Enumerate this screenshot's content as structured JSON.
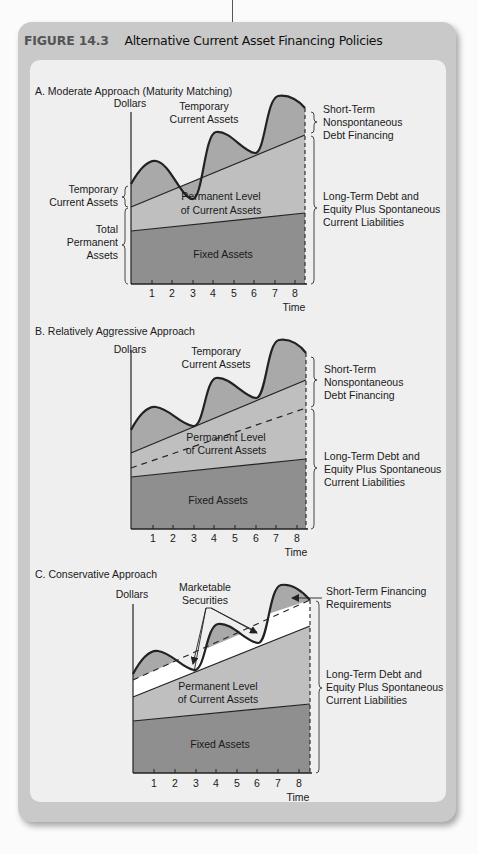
{
  "figure": {
    "number": "FIGURE 14.3",
    "title": "Alternative Current Asset Financing Policies"
  },
  "colors": {
    "frame": "#c9c9c9",
    "panel_bg": "#efefef",
    "temporary_area": "#a9a9a9",
    "permanent_current_area": "#bfbfbf",
    "fixed_area": "#8f8f8f",
    "marketable_securities": "#ffffff",
    "line": "#222222"
  },
  "panels": [
    {
      "id": "A",
      "heading": "A. Moderate Approach (Maturity Matching)",
      "y_label": "Dollars",
      "x_label": "Time",
      "ticks": [
        "1",
        "2",
        "3",
        "4",
        "5",
        "6",
        "7",
        "8"
      ],
      "area_labels": {
        "temporary": [
          "Temporary",
          "Current Assets"
        ],
        "permanent": [
          "Permanent Level",
          "of Current Assets"
        ],
        "fixed": "Fixed Assets"
      },
      "left_braces": [
        {
          "label": [
            "Temporary",
            "Current Assets"
          ]
        },
        {
          "label": [
            "Total",
            "Permanent",
            "Assets"
          ]
        }
      ],
      "right_braces": [
        {
          "label": [
            "Short-Term",
            "Nonspontaneous",
            "Debt Financing"
          ]
        },
        {
          "label": [
            "Long-Term Debt and",
            "Equity Plus Spontaneous",
            "Current Liabilities"
          ]
        }
      ]
    },
    {
      "id": "B",
      "heading": "B. Relatively Aggressive Approach",
      "y_label": "Dollars",
      "x_label": "Time",
      "ticks": [
        "1",
        "2",
        "3",
        "4",
        "5",
        "6",
        "7",
        "8"
      ],
      "area_labels": {
        "temporary": [
          "Temporary",
          "Current Assets"
        ],
        "permanent": [
          "Permanent Level",
          "of Current Assets"
        ],
        "fixed": "Fixed Assets"
      },
      "right_braces": [
        {
          "label": [
            "Short-Term",
            "Nonspontaneous",
            "Debt Financing"
          ]
        },
        {
          "label": [
            "Long-Term Debt and",
            "Equity Plus Spontaneous",
            "Current Liabilities"
          ]
        }
      ]
    },
    {
      "id": "C",
      "heading": "C. Conservative Approach",
      "y_label": "Dollars",
      "x_label": "Time",
      "ticks": [
        "1",
        "2",
        "3",
        "4",
        "5",
        "6",
        "7",
        "8"
      ],
      "area_labels": {
        "marketable": [
          "Marketable",
          "Securities"
        ],
        "permanent": [
          "Permanent Level",
          "of Current Assets"
        ],
        "fixed": "Fixed Assets"
      },
      "annotations": {
        "short_term": [
          "Short-Term Financing",
          "Requirements"
        ]
      },
      "right_braces": [
        {
          "label": [
            "Long-Term Debt and",
            "Equity Plus Spontaneous",
            "Current Liabilities"
          ]
        }
      ]
    }
  ]
}
